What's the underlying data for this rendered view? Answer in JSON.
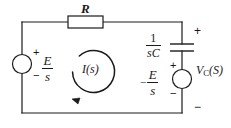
{
  "figure": {
    "kind": "electrical-circuit-schematic",
    "domain_note": "s-domain RC series circuit with two independent sources",
    "background_color": "#ffffff",
    "line_color": "#1a1a1a"
  },
  "components": {
    "resistor": {
      "label": "R",
      "name": "resistor"
    },
    "capacitor": {
      "label_numerator": "1",
      "label_denominator": "sC",
      "name": "capacitor"
    },
    "source_left": {
      "name": "voltage-source-left",
      "plus": "+",
      "minus": "−",
      "label_numerator": "E",
      "label_denominator": "s"
    },
    "source_right": {
      "name": "voltage-source-right",
      "plus": "+",
      "minus": "−",
      "leading_sign": "−",
      "label_numerator": "E",
      "label_denominator": "s"
    }
  },
  "annotations": {
    "loop_current": "I(s)",
    "output_voltage_symbol": "V",
    "output_voltage_subscript": "C",
    "output_voltage_arg": "(S)",
    "output_plus": "+",
    "output_minus": "−"
  }
}
